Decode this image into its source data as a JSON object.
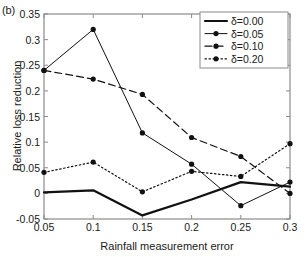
{
  "panel": {
    "label": "(b)"
  },
  "chart_data": {
    "type": "line",
    "title": "",
    "xlabel": "Rainfall measurement error",
    "ylabel": "Relative loss reduction",
    "x": [
      0.05,
      0.1,
      0.15,
      0.2,
      0.25,
      0.3
    ],
    "xlim": [
      0.05,
      0.3
    ],
    "ylim": [
      -0.05,
      0.35
    ],
    "xticks": [
      "0.05",
      "0.1",
      "0.15",
      "0.2",
      "0.25",
      "0.3"
    ],
    "yticks": [
      "-0.05",
      "0",
      "0.05",
      "0.1",
      "0.15",
      "0.2",
      "0.25",
      "0.3",
      "0.35"
    ],
    "grid": false,
    "legend_position": "top-right",
    "series": [
      {
        "name": "δ=0.00",
        "style": "solid-thick",
        "markers": false,
        "values": [
          0.002,
          0.006,
          -0.043,
          -0.012,
          0.022,
          0.013
        ]
      },
      {
        "name": "δ=0.05",
        "style": "solid",
        "markers": true,
        "values": [
          0.24,
          0.32,
          0.118,
          0.057,
          -0.024,
          0.022
        ]
      },
      {
        "name": "δ=0.10",
        "style": "dashed",
        "markers": true,
        "values": [
          0.24,
          0.223,
          0.193,
          0.109,
          0.072,
          0.0
        ]
      },
      {
        "name": "δ=0.20",
        "style": "dotted",
        "markers": true,
        "values": [
          0.041,
          0.061,
          0.003,
          0.043,
          0.033,
          0.097
        ]
      }
    ]
  },
  "legend": {
    "entries": [
      {
        "label": "δ=0.00"
      },
      {
        "label": "δ=0.05"
      },
      {
        "label": "δ=0.10"
      },
      {
        "label": "δ=0.20"
      }
    ]
  }
}
